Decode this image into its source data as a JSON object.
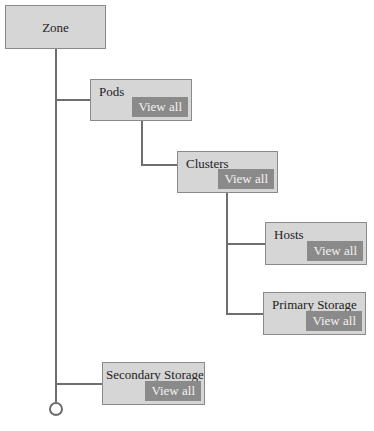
{
  "diagram": {
    "zone": {
      "label": "Zone"
    },
    "pods": {
      "label": "Pods",
      "action": "View all"
    },
    "clusters": {
      "label": "Clusters",
      "action": "View all"
    },
    "hosts": {
      "label": "Hosts",
      "action": "View all"
    },
    "primary_storage": {
      "label": "Primary Storage",
      "action": "View all"
    },
    "secondary_storage": {
      "label": "Secondary Storage",
      "action": "View all"
    }
  },
  "colors": {
    "node_bg": "#d6d6d6",
    "node_border": "#8a8a8a",
    "button_bg": "#8a8a8a",
    "connector": "#6e6e6e"
  }
}
